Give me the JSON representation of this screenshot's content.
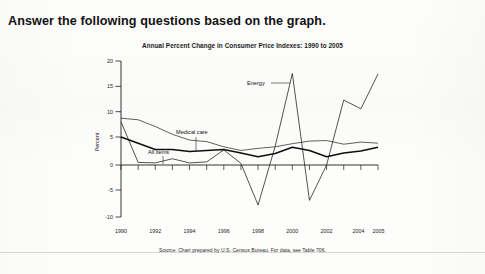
{
  "worksheet": {
    "instruction": "Answer the following questions based on the graph."
  },
  "figure": {
    "title": "Annual Percent Change in Consumer Price Indexes: 1990 to 2005",
    "source": "Source: Chart prepared by U.S. Census Bureau. For data, see Table 706."
  },
  "chart_data": {
    "type": "line",
    "title": "Annual Percent Change in Consumer Price Indexes: 1990 to 2005",
    "xlabel": "",
    "ylabel": "Percent",
    "ylim": [
      -10,
      20
    ],
    "xlim": [
      1990,
      2005
    ],
    "yticks": [
      -10,
      -5,
      0,
      5,
      10,
      15,
      20
    ],
    "ytick_labels": [
      "-10",
      "-5",
      "0",
      "5",
      "10",
      "15",
      "20"
    ],
    "xticks": [
      1990,
      1992,
      1994,
      1996,
      1998,
      2000,
      2002,
      2004,
      2005
    ],
    "xtick_labels": [
      "1990",
      "1992",
      "1994",
      "1996",
      "1998",
      "2000",
      "2002",
      "2004",
      "2005"
    ],
    "x": [
      1990,
      1991,
      1992,
      1993,
      1994,
      1995,
      1996,
      1997,
      1998,
      1999,
      2000,
      2001,
      2002,
      2003,
      2004,
      2005
    ],
    "grid": false,
    "legend_position": "inline-annotations",
    "series": [
      {
        "name": "All items",
        "label": "All items",
        "style": "thick-black",
        "values": [
          5.4,
          4.2,
          3.0,
          3.0,
          2.6,
          2.8,
          3.0,
          2.3,
          1.6,
          2.2,
          3.4,
          2.8,
          1.6,
          2.3,
          2.7,
          3.4
        ]
      },
      {
        "name": "Medical care",
        "label": "Medical care",
        "style": "thin-gray",
        "values": [
          9.0,
          8.7,
          7.4,
          5.9,
          4.8,
          4.5,
          3.5,
          2.8,
          3.2,
          3.5,
          4.1,
          4.6,
          4.7,
          4.0,
          4.4,
          4.2
        ]
      },
      {
        "name": "Energy",
        "label": "Energy",
        "style": "thin-black",
        "values": [
          8.3,
          0.5,
          0.4,
          1.2,
          0.4,
          0.6,
          2.9,
          0.3,
          -7.7,
          3.6,
          17.6,
          -6.8,
          0.0,
          12.5,
          10.8,
          17.5
        ]
      }
    ],
    "annotations": [
      {
        "text": "Medical care",
        "points_to_series": "Medical care",
        "points_to_x": 1994
      },
      {
        "text": "All items",
        "points_to_series": "All items",
        "points_to_x": 1993
      },
      {
        "text": "Energy",
        "points_to_series": "Energy",
        "points_to_x": 2000
      }
    ]
  }
}
